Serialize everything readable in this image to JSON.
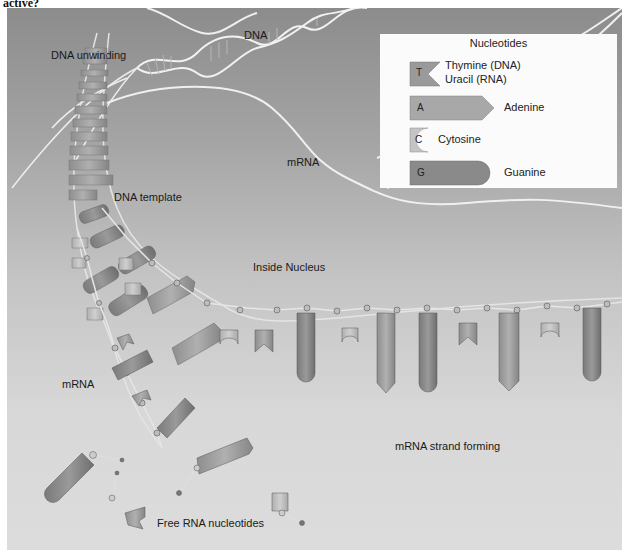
{
  "question_fragment": "active?",
  "diagram": {
    "labels": {
      "dna": "DNA",
      "dna_unwinding": "DNA unwinding",
      "mrna_top": "mRNA",
      "dna_template": "DNA template",
      "inside_nucleus": "Inside Nucleus",
      "mrna_left": "mRNA",
      "mrna_strand_forming": "mRNA strand forming",
      "free_rna_nucleotides": "Free RNA nucleotides"
    },
    "legend": {
      "title": "Nucleotides",
      "items": [
        {
          "letter": "T",
          "name": "Thymine (DNA)",
          "name2": "Uracil (RNA)",
          "shape": "notch",
          "color": "#9a9a9a"
        },
        {
          "letter": "A",
          "name": "Adenine",
          "shape": "arrow",
          "color": "#a8a8a8"
        },
        {
          "letter": "C",
          "name": "Cytosine",
          "shape": "cup",
          "color": "#c2c2c2"
        },
        {
          "letter": "G",
          "name": "Guanine",
          "shape": "rounded",
          "color": "#8a8a8a"
        }
      ]
    },
    "colors": {
      "background_top": "#8c8c8c",
      "background_bottom": "#dcdcdc",
      "legend_bg": "#fbfbfb",
      "backbone": "#e8e8e8"
    }
  }
}
